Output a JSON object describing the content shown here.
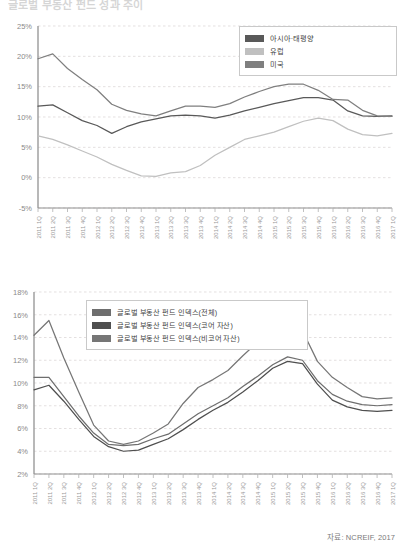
{
  "document": {
    "title_partial": "글로벌 부동산 펀드 성과 추이",
    "source_note": "자료: NCREIF, 2017"
  },
  "chart_data": [
    {
      "type": "line",
      "id": "regional-returns",
      "title": "",
      "xlabel": "",
      "ylabel": "",
      "ylim": [
        -5,
        25
      ],
      "yticks": [
        "-5%",
        "0%",
        "5%",
        "10%",
        "15%",
        "20%",
        "25%"
      ],
      "ytick_values": [
        -5,
        0,
        5,
        10,
        15,
        20,
        25
      ],
      "grid": true,
      "legend_position": "top-right",
      "categories": [
        "2011 1Q",
        "2011 2Q",
        "2011 3Q",
        "2011 4Q",
        "2012 1Q",
        "2012 2Q",
        "2012 3Q",
        "2012 4Q",
        "2013 1Q",
        "2013 2Q",
        "2013 3Q",
        "2013 4Q",
        "2014 1Q",
        "2014 2Q",
        "2014 3Q",
        "2014 4Q",
        "2015 1Q",
        "2015 2Q",
        "2015 3Q",
        "2015 4Q",
        "2016 1Q",
        "2016 2Q",
        "2016 3Q",
        "2016 4Q",
        "2017 1Q"
      ],
      "series": [
        {
          "name": "아시아·태평양",
          "color": "#595959",
          "values": [
            11.8,
            12.0,
            10.7,
            9.4,
            8.6,
            7.3,
            8.4,
            9.2,
            9.7,
            10.2,
            10.3,
            10.2,
            9.8,
            10.3,
            11.0,
            11.6,
            12.2,
            12.7,
            13.2,
            13.2,
            12.8,
            11.0,
            10.2,
            10.1,
            10.2
          ]
        },
        {
          "name": "유럽",
          "color": "#c0c0c0",
          "values": [
            6.9,
            6.3,
            5.4,
            4.4,
            3.4,
            2.2,
            1.2,
            0.3,
            0.2,
            0.8,
            1.0,
            2.0,
            3.7,
            5.0,
            6.3,
            6.9,
            7.5,
            8.4,
            9.3,
            9.8,
            9.4,
            8.0,
            7.1,
            6.9,
            7.3
          ]
        },
        {
          "name": "미국",
          "color": "#7f7f7f",
          "values": [
            19.6,
            20.4,
            18.0,
            16.2,
            14.5,
            12.1,
            11.1,
            10.5,
            10.2,
            11.0,
            11.8,
            11.8,
            11.6,
            12.2,
            13.3,
            14.2,
            15.0,
            15.4,
            15.4,
            14.4,
            12.9,
            12.8,
            11.1,
            10.2,
            10.1
          ]
        }
      ]
    },
    {
      "type": "line",
      "id": "fund-index-returns",
      "title": "",
      "xlabel": "",
      "ylabel": "",
      "ylim": [
        2,
        18
      ],
      "yticks": [
        "2%",
        "4%",
        "6%",
        "8%",
        "10%",
        "12%",
        "14%",
        "16%",
        "18%"
      ],
      "ytick_values": [
        2,
        4,
        6,
        8,
        10,
        12,
        14,
        16,
        18
      ],
      "grid": true,
      "legend_position": "top-left",
      "categories": [
        "2011 1Q",
        "2011 2Q",
        "2011 3Q",
        "2011 4Q",
        "2012 1Q",
        "2012 2Q",
        "2012 3Q",
        "2012 4Q",
        "2013 1Q",
        "2013 2Q",
        "2013 3Q",
        "2013 4Q",
        "2014 1Q",
        "2014 2Q",
        "2014 3Q",
        "2014 4Q",
        "2015 1Q",
        "2015 2Q",
        "2015 3Q",
        "2015 4Q",
        "2016 1Q",
        "2016 2Q",
        "2016 3Q",
        "2016 4Q",
        "2017 1Q"
      ],
      "series": [
        {
          "name": "글로벌 부동산 펀드 인덱스(전체)",
          "color": "#6e6e6e",
          "values": [
            10.5,
            10.5,
            8.8,
            7.1,
            5.6,
            4.6,
            4.5,
            4.6,
            5.1,
            5.5,
            6.4,
            7.3,
            8.0,
            8.7,
            9.7,
            10.6,
            11.6,
            12.3,
            12.0,
            10.2,
            9.0,
            8.4,
            8.1,
            8.0,
            8.1
          ]
        },
        {
          "name": "글로벌 부동산 펀드 인덱스(코어 자산)",
          "color": "#4f4f4f",
          "values": [
            9.4,
            9.8,
            8.4,
            6.8,
            5.3,
            4.4,
            4.0,
            4.1,
            4.6,
            5.1,
            5.9,
            6.8,
            7.6,
            8.3,
            9.2,
            10.2,
            11.3,
            11.9,
            11.7,
            9.9,
            8.5,
            7.9,
            7.6,
            7.5,
            7.6
          ]
        },
        {
          "name": "글로벌 부동산 펀드 인덱스(비코어 자산)",
          "color": "#767676",
          "values": [
            14.2,
            15.5,
            12.2,
            9.2,
            6.3,
            4.9,
            4.6,
            4.9,
            5.6,
            6.4,
            8.2,
            9.6,
            10.3,
            11.1,
            12.4,
            13.6,
            14.9,
            15.1,
            14.6,
            11.9,
            10.5,
            9.6,
            8.8,
            8.6,
            8.7
          ]
        }
      ]
    }
  ]
}
